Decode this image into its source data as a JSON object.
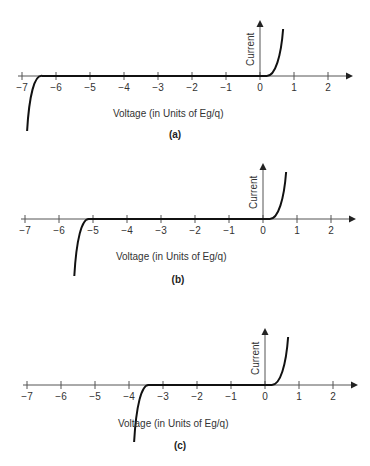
{
  "figure": {
    "xlabel": "Voltage (in Units of Eg/q)",
    "ylabel": "Current",
    "x_ticks": [
      "−7",
      "−6",
      "−5",
      "−4",
      "−3",
      "−2",
      "−1",
      "0",
      "1",
      "2"
    ],
    "panels": [
      {
        "label": "(a)",
        "breakdown_voltage": -6.4
      },
      {
        "label": "(b)",
        "breakdown_voltage": -5.1
      },
      {
        "label": "(c)",
        "breakdown_voltage": -3.4
      }
    ]
  },
  "chart_data": [
    {
      "type": "line",
      "title": "(a)",
      "xlabel": "Voltage (in Units of Eg/q)",
      "ylabel": "Current",
      "xlim": [
        -7,
        2.5
      ],
      "x_ticks": [
        -7,
        -6,
        -5,
        -4,
        -3,
        -2,
        -1,
        0,
        1,
        2
      ],
      "grid": false,
      "series": [
        {
          "name": "I-V curve",
          "breakdown": -6.4,
          "forward_turn_on": 0.2,
          "x": [
            -6.9,
            -6.7,
            -6.5,
            -6.4,
            -3,
            0,
            0.2,
            0.4,
            0.55,
            0.68
          ],
          "y": [
            -1.0,
            -0.5,
            -0.1,
            0,
            0,
            0,
            0,
            0.15,
            0.45,
            1.0
          ]
        }
      ]
    },
    {
      "type": "line",
      "title": "(b)",
      "xlabel": "Voltage (in Units of Eg/q)",
      "ylabel": "Current",
      "xlim": [
        -7,
        2.5
      ],
      "x_ticks": [
        -7,
        -6,
        -5,
        -4,
        -3,
        -2,
        -1,
        0,
        1,
        2
      ],
      "grid": false,
      "series": [
        {
          "name": "I-V curve",
          "breakdown": -5.1,
          "forward_turn_on": 0.2,
          "x": [
            -5.5,
            -5.35,
            -5.2,
            -5.1,
            -3,
            0,
            0.2,
            0.4,
            0.55,
            0.68
          ],
          "y": [
            -1.0,
            -0.5,
            -0.1,
            0,
            0,
            0,
            0,
            0.15,
            0.45,
            1.0
          ]
        }
      ]
    },
    {
      "type": "line",
      "title": "(c)",
      "xlabel": "Voltage (in Units of Eg/q)",
      "ylabel": "Current",
      "xlim": [
        -7,
        2.5
      ],
      "x_ticks": [
        -7,
        -6,
        -5,
        -4,
        -3,
        -2,
        -1,
        0,
        1,
        2
      ],
      "grid": false,
      "series": [
        {
          "name": "I-V curve",
          "breakdown": -3.4,
          "forward_turn_on": 0.2,
          "x": [
            -3.85,
            -3.7,
            -3.5,
            -3.4,
            -2,
            0,
            0.2,
            0.4,
            0.55,
            0.68
          ],
          "y": [
            -1.0,
            -0.5,
            -0.1,
            0,
            0,
            0,
            0,
            0.15,
            0.45,
            1.0
          ]
        }
      ]
    }
  ]
}
